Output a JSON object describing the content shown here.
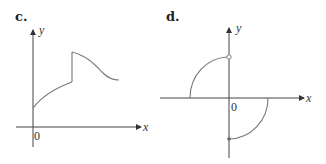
{
  "panels": [
    {
      "id": "c",
      "label": "c.",
      "x_axis_label": "x",
      "y_axis_label": "y",
      "origin_label": "0",
      "description": "Increasing concave curve starting on positive y-axis, jump discontinuity upward, then decreasing curve"
    },
    {
      "id": "d",
      "label": "d.",
      "x_axis_label": "x",
      "y_axis_label": "y",
      "origin_label": "0",
      "description": "Quarter-circle arc in quadrant II ending at open circle on positive y-axis; quarter-circle arc in quadrant IV starting at closed dot on negative y-axis",
      "markers": [
        {
          "type": "open-circle",
          "position": "positive y-axis"
        },
        {
          "type": "closed-dot",
          "position": "negative y-axis"
        }
      ]
    }
  ],
  "colors": {
    "axis": "#444444",
    "curve": "#777777",
    "background": "#ffffff"
  }
}
